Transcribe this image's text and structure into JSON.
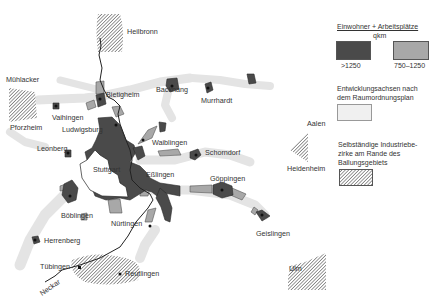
{
  "map": {
    "cities": [
      {
        "name": "Heilbronn",
        "x": 127,
        "y": 34
      },
      {
        "name": "Mühlacker",
        "x": 6,
        "y": 82
      },
      {
        "name": "Pforzheim",
        "x": 10,
        "y": 128
      },
      {
        "name": "Bietigheim",
        "x": 106,
        "y": 97
      },
      {
        "name": "Vaihingen",
        "x": 52,
        "y": 120
      },
      {
        "name": "Ludwigsburg",
        "x": 62,
        "y": 132
      },
      {
        "name": "Backnang",
        "x": 156,
        "y": 92
      },
      {
        "name": "Murrhardt",
        "x": 201,
        "y": 102
      },
      {
        "name": "Waiblingen",
        "x": 152,
        "y": 144
      },
      {
        "name": "Schorndorf",
        "x": 205,
        "y": 153
      },
      {
        "name": "Leonberg",
        "x": 37,
        "y": 149
      },
      {
        "name": "Stuttgart",
        "x": 94,
        "y": 170
      },
      {
        "name": "Eßlingen",
        "x": 146,
        "y": 175
      },
      {
        "name": "Göppingen",
        "x": 210,
        "y": 180
      },
      {
        "name": "Böblingen",
        "x": 61,
        "y": 217
      },
      {
        "name": "Nürtingen",
        "x": 111,
        "y": 225
      },
      {
        "name": "Herrenberg",
        "x": 44,
        "y": 242
      },
      {
        "name": "Geislingen",
        "x": 257,
        "y": 234
      },
      {
        "name": "Aalen",
        "x": 307,
        "y": 124
      },
      {
        "name": "Heidenheim",
        "x": 287,
        "y": 169
      },
      {
        "name": "Tübingen",
        "x": 40,
        "y": 268
      },
      {
        "name": "Reutlingen",
        "x": 125,
        "y": 274
      },
      {
        "name": "Ulm",
        "x": 289,
        "y": 271
      }
    ],
    "river_label": "Neckar"
  },
  "legend": {
    "density_title": "Einwohner + Arbeitsplätze",
    "density_unit": "qkm",
    "high_label": ">1250",
    "mid_label": "750–1250",
    "axes_title_line1": "Entwicklungsachsen nach",
    "axes_title_line2": "dem Raumordnungsplan",
    "industry_line1": "Selbständige Industriebe-",
    "industry_line2": "zirke am Rande des",
    "industry_line3": "Ballungsgebiets"
  },
  "colors": {
    "high_density": "#4a4a4a",
    "mid_density": "#a8a8a8",
    "axis_band": "#e6e6e6",
    "hatch": "#555555",
    "river": "#222222"
  }
}
